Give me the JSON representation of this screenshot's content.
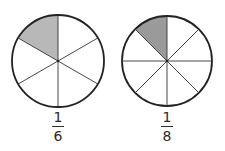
{
  "colors": {
    "stroke": "#222222",
    "shaded": "#b8b8b8",
    "background": "#ffffff"
  },
  "circles": [
    {
      "id": "sixths",
      "segments": 6,
      "shaded_segments": 1,
      "fraction": {
        "numerator": "1",
        "denominator": "6"
      }
    },
    {
      "id": "eighths",
      "segments": 8,
      "shaded_segments": 1,
      "fraction": {
        "numerator": "1",
        "denominator": "8"
      }
    }
  ]
}
